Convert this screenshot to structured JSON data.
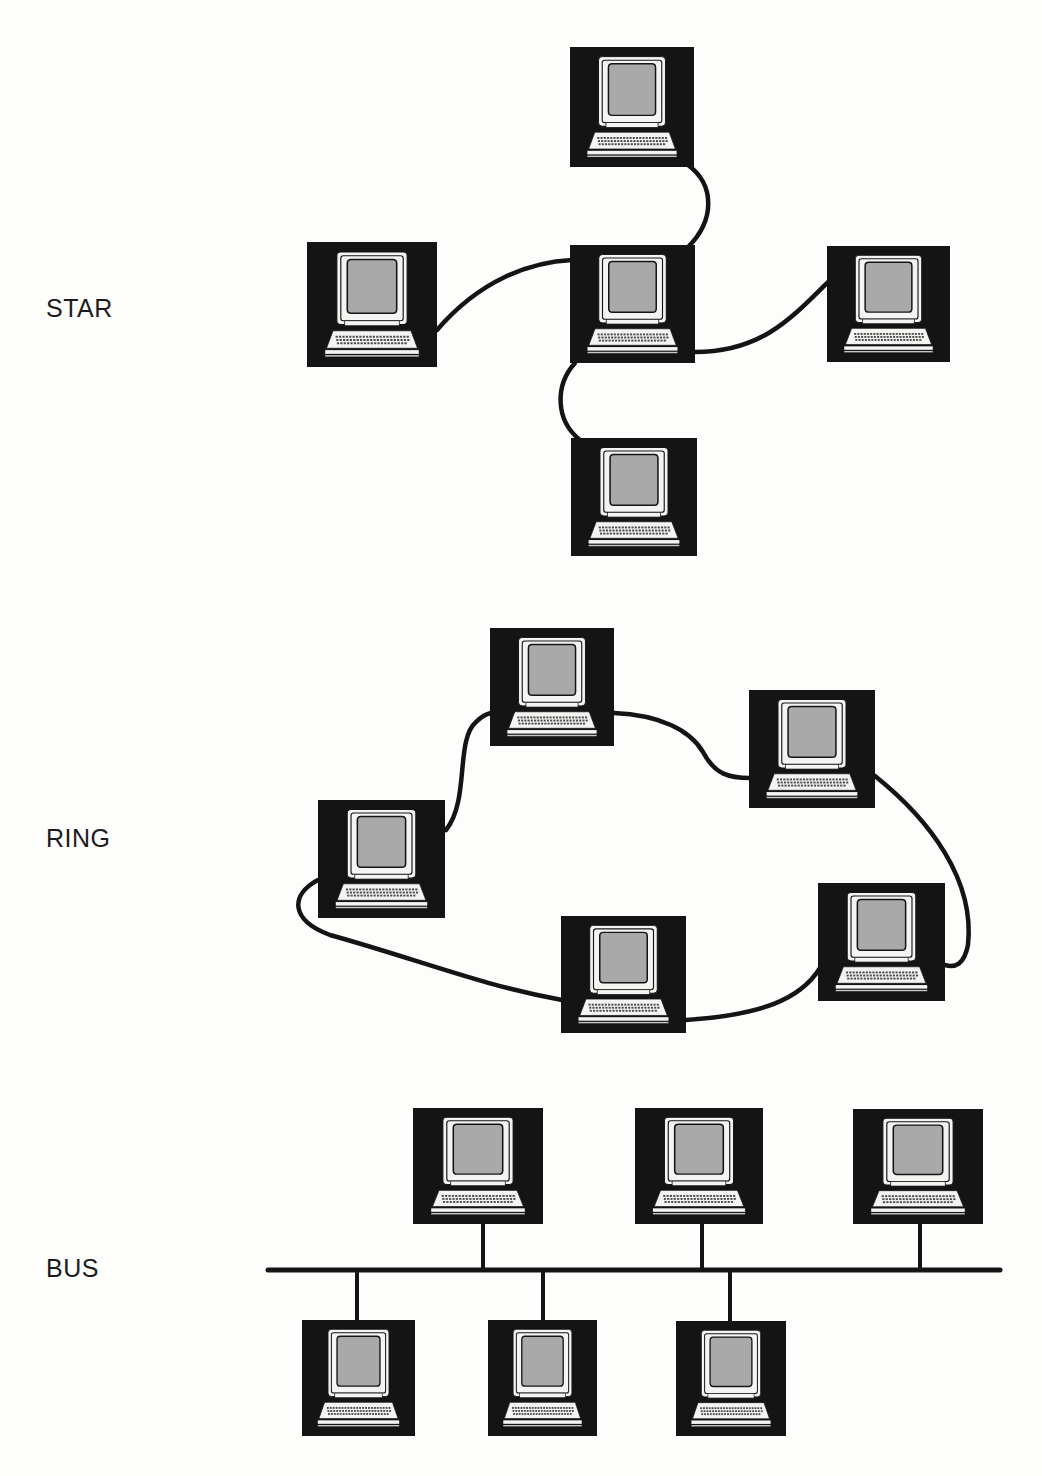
{
  "colors": {
    "ink": "#141414",
    "screen": "#a9a9a9",
    "paper": "#fdfdfc",
    "monitor": "#f4f4f2"
  },
  "sections": [
    {
      "id": "star",
      "label": "STAR",
      "label_pos": [
        46,
        296
      ],
      "nodes": [
        {
          "name": "star-top-computer",
          "x": 570,
          "y": 47,
          "w": 124,
          "h": 120
        },
        {
          "name": "star-left-computer",
          "x": 307,
          "y": 242,
          "w": 130,
          "h": 125
        },
        {
          "name": "star-hub-computer",
          "x": 570,
          "y": 245,
          "w": 125,
          "h": 118
        },
        {
          "name": "star-right-computer",
          "x": 827,
          "y": 246,
          "w": 123,
          "h": 116
        },
        {
          "name": "star-bottom-computer",
          "x": 571,
          "y": 438,
          "w": 126,
          "h": 118
        }
      ],
      "links": [
        {
          "name": "star-link-top",
          "d": "M688 165 C 715 185, 715 220, 688 247"
        },
        {
          "name": "star-link-left",
          "d": "M437 330 C 480 280, 530 262, 572 260"
        },
        {
          "name": "star-link-right",
          "d": "M695 352 C 760 352, 790 320, 829 281"
        },
        {
          "name": "star-link-bottom",
          "d": "M575 363 C 555 385, 555 420, 580 440"
        }
      ]
    },
    {
      "id": "ring",
      "label": "RING",
      "label_pos": [
        46,
        826
      ],
      "nodes": [
        {
          "name": "ring-top-computer",
          "x": 490,
          "y": 628,
          "w": 124,
          "h": 118
        },
        {
          "name": "ring-top-right-computer",
          "x": 749,
          "y": 690,
          "w": 126,
          "h": 118
        },
        {
          "name": "ring-left-computer",
          "x": 318,
          "y": 800,
          "w": 127,
          "h": 118
        },
        {
          "name": "ring-bottom-computer",
          "x": 561,
          "y": 916,
          "w": 125,
          "h": 117
        },
        {
          "name": "ring-bottom-right-computer",
          "x": 818,
          "y": 883,
          "w": 127,
          "h": 118
        }
      ],
      "links": [
        {
          "name": "ring-link-left-top",
          "d": "M446 830 C 470 800, 455 740, 476 722 C 482 716, 486 714, 491 713"
        },
        {
          "name": "ring-link-top-topright",
          "d": "M614 713 C 660 715, 690 730, 703 752 C 715 775, 730 778, 750 778"
        },
        {
          "name": "ring-link-topright-bright",
          "d": "M875 776 C 930 820, 975 880, 968 945 C 964 965, 955 968, 945 965"
        },
        {
          "name": "ring-link-bright-bottom",
          "d": "M820 968 C 800 1000, 760 1015, 686 1020"
        },
        {
          "name": "ring-link-bottom-left",
          "d": "M562 1000 C 480 985, 420 960, 330 935 C 290 920, 290 895, 318 880"
        }
      ]
    },
    {
      "id": "bus",
      "label": "BUS",
      "label_pos": [
        46,
        1256
      ],
      "bus_line": {
        "x1": 268,
        "x2": 1000,
        "y": 1270
      },
      "nodes": [
        {
          "name": "bus-top-computer-1",
          "x": 413,
          "y": 1108,
          "w": 130,
          "h": 116,
          "drop_x": 483,
          "side": "top"
        },
        {
          "name": "bus-top-computer-2",
          "x": 635,
          "y": 1108,
          "w": 128,
          "h": 116,
          "drop_x": 702,
          "side": "top"
        },
        {
          "name": "bus-top-computer-3",
          "x": 853,
          "y": 1109,
          "w": 130,
          "h": 115,
          "drop_x": 920,
          "side": "top"
        },
        {
          "name": "bus-bottom-computer-1",
          "x": 302,
          "y": 1320,
          "w": 113,
          "h": 116,
          "drop_x": 357,
          "side": "bottom"
        },
        {
          "name": "bus-bottom-computer-2",
          "x": 488,
          "y": 1320,
          "w": 109,
          "h": 116,
          "drop_x": 543,
          "side": "bottom"
        },
        {
          "name": "bus-bottom-computer-3",
          "x": 676,
          "y": 1321,
          "w": 110,
          "h": 115,
          "drop_x": 730,
          "side": "bottom"
        }
      ]
    }
  ]
}
